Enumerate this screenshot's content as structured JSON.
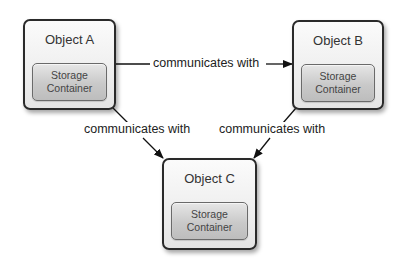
{
  "diagram": {
    "nodes": [
      {
        "id": "A",
        "title": "Object A",
        "inner": {
          "line1": "Storage",
          "line2": "Container"
        }
      },
      {
        "id": "B",
        "title": "Object B",
        "inner": {
          "line1": "Storage",
          "line2": "Container"
        }
      },
      {
        "id": "C",
        "title": "Object C",
        "inner": {
          "line1": "Storage",
          "line2": "Container"
        }
      }
    ],
    "edges": [
      {
        "from": "A",
        "to": "B",
        "label": "communicates with"
      },
      {
        "from": "A",
        "to": "C",
        "label": "communicates with"
      },
      {
        "from": "B",
        "to": "C",
        "label": "communicates with"
      }
    ],
    "colors": {
      "border": "#2a2a2a",
      "box_fill": "#eeeeee",
      "storage_fill": "#c9c9c9",
      "line": "#111111",
      "text": "#333333"
    }
  }
}
